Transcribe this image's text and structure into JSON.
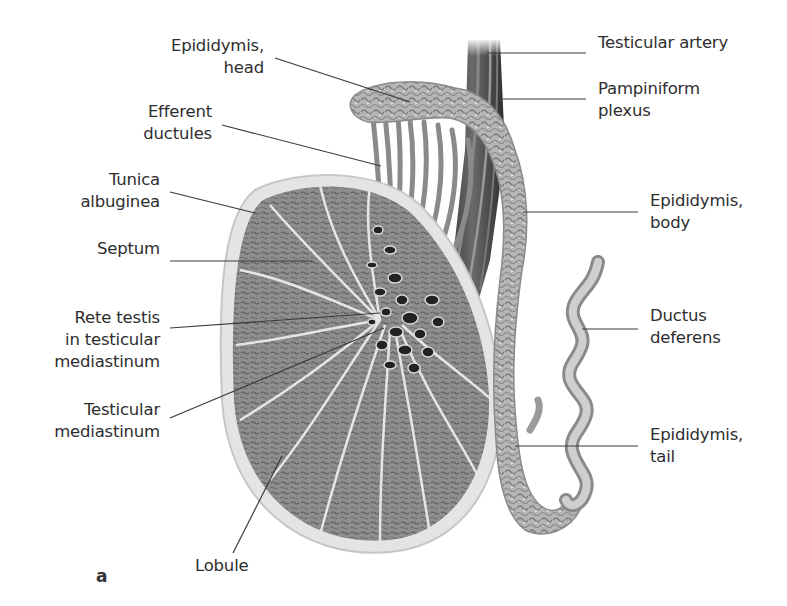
{
  "figure": {
    "panel_letter": "a",
    "colors": {
      "background": "#ffffff",
      "text": "#2e2e2e",
      "leader_line": "#3a3a3a",
      "parenchyma": "#8e8e8e",
      "tunica": "#dcdcdc",
      "septa": "#e4e4e4",
      "epididymis": "#b8b8b8",
      "vessels_dark": "#3c3c3c",
      "ductus": "#c4c4c4"
    }
  },
  "labels_left": [
    {
      "id": "epididymis-head",
      "text": "Epididymis,\nhead",
      "x": 160,
      "y": 46,
      "w": 104,
      "line": [
        275,
        58,
        410,
        102
      ]
    },
    {
      "id": "efferent-ductules",
      "text": "Efferent\nductules",
      "x": 120,
      "y": 112,
      "w": 92,
      "line": [
        222,
        125,
        381,
        166
      ]
    },
    {
      "id": "tunica-albuginea",
      "text": "Tunica\nalbuginea",
      "x": 60,
      "y": 180,
      "w": 100,
      "line": [
        170,
        192,
        255,
        213
      ]
    },
    {
      "id": "septum",
      "text": "Septum",
      "x": 60,
      "y": 249,
      "w": 100,
      "line": [
        170,
        261,
        313,
        261
      ]
    },
    {
      "id": "rete-testis",
      "text": "Rete testis\nin testicular\nmediastinum",
      "x": 30,
      "y": 318,
      "w": 130,
      "line": [
        170,
        328,
        380,
        313
      ]
    },
    {
      "id": "testicular-mediastinum",
      "text": "Testicular\nmediastinum",
      "x": 30,
      "y": 410,
      "w": 130,
      "line": [
        170,
        418,
        384,
        328
      ]
    },
    {
      "id": "lobule",
      "text": "Lobule",
      "x": 195,
      "y": 566,
      "w": 70,
      "line": [
        233,
        553,
        282,
        456
      ],
      "align": "left"
    }
  ],
  "labels_right": [
    {
      "id": "testicular-artery",
      "text": "Testicular artery",
      "x": 598,
      "y": 43,
      "line": [
        487,
        53,
        586,
        53
      ]
    },
    {
      "id": "pampiniform-plexus",
      "text": "Pampiniform\nplexus",
      "x": 598,
      "y": 89,
      "line": [
        503,
        99,
        586,
        99
      ]
    },
    {
      "id": "epididymis-body",
      "text": "Epididymis,\nbody",
      "x": 650,
      "y": 201,
      "line": [
        523,
        212,
        638,
        212
      ]
    },
    {
      "id": "ductus-deferens",
      "text": "Ductus\ndeferens",
      "x": 650,
      "y": 316,
      "line": [
        582,
        329,
        638,
        329
      ]
    },
    {
      "id": "epididymis-tail",
      "text": "Epididymis,\ntail",
      "x": 650,
      "y": 435,
      "line": [
        515,
        446,
        638,
        446
      ]
    }
  ]
}
